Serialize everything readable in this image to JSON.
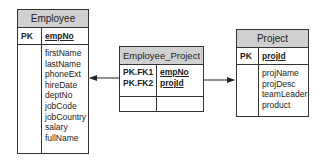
{
  "entities": {
    "employee": {
      "title": "Employee",
      "pk_label": "PK",
      "pk_field": "empNo",
      "attributes": [
        "firstName",
        "lastName",
        "phoneExt",
        "hireDate",
        "deptNo",
        "jobCode",
        "jobCountry",
        "salary",
        "fullName"
      ]
    },
    "employee_project": {
      "title": "Employee_Project",
      "keys": [
        {
          "label": "PK.FK1",
          "field": "empNo"
        },
        {
          "label": "PK.FK2",
          "field": "projId"
        }
      ]
    },
    "project": {
      "title": "Project",
      "pk_label": "PK",
      "pk_field": "projId",
      "attributes": [
        "projName",
        "projDesc",
        "teamLeader",
        "product"
      ]
    }
  },
  "relationships": [
    {
      "from": "Employee_Project",
      "to": "Employee",
      "via": "empNo"
    },
    {
      "from": "Employee_Project",
      "to": "Project",
      "via": "projId"
    }
  ]
}
